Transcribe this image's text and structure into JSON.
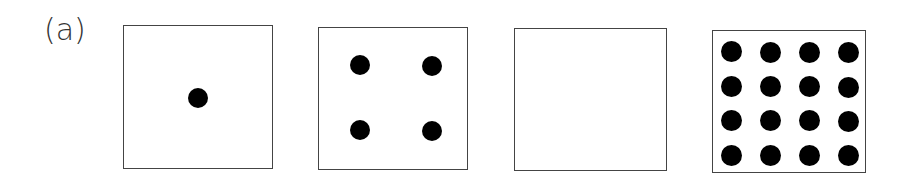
{
  "figure": {
    "label": "(a)",
    "panels": [
      {
        "id": "panel-1",
        "dot_count": 1,
        "grid": [
          1,
          1
        ],
        "box": {
          "x": 123,
          "y": 25,
          "w": 150,
          "h": 144
        },
        "dots": [
          [
            198,
            98
          ]
        ]
      },
      {
        "id": "panel-2",
        "dot_count": 4,
        "grid": [
          2,
          2
        ],
        "box": {
          "x": 318,
          "y": 27,
          "w": 150,
          "h": 143
        },
        "dots": [
          [
            360,
            65
          ],
          [
            432,
            66
          ],
          [
            360,
            130
          ],
          [
            432,
            131
          ]
        ]
      },
      {
        "id": "panel-3",
        "dot_count": 0,
        "grid": [
          0,
          0
        ],
        "box": {
          "x": 514,
          "y": 28,
          "w": 153,
          "h": 143
        },
        "dots": []
      },
      {
        "id": "panel-4",
        "dot_count": 16,
        "grid": [
          4,
          4
        ],
        "box": {
          "x": 712,
          "y": 30,
          "w": 154,
          "h": 143
        },
        "dots": [
          [
            731,
            51
          ],
          [
            770,
            52
          ],
          [
            809,
            52
          ],
          [
            848,
            52
          ],
          [
            731,
            86
          ],
          [
            770,
            86
          ],
          [
            809,
            86
          ],
          [
            848,
            87
          ],
          [
            731,
            120
          ],
          [
            770,
            120
          ],
          [
            809,
            120
          ],
          [
            848,
            121
          ],
          [
            731,
            155
          ],
          [
            770,
            155
          ],
          [
            809,
            155
          ],
          [
            848,
            155
          ]
        ]
      }
    ],
    "colors": {
      "border": "#444444",
      "dot": "#000000",
      "label": "#333333",
      "background": "#ffffff"
    }
  }
}
